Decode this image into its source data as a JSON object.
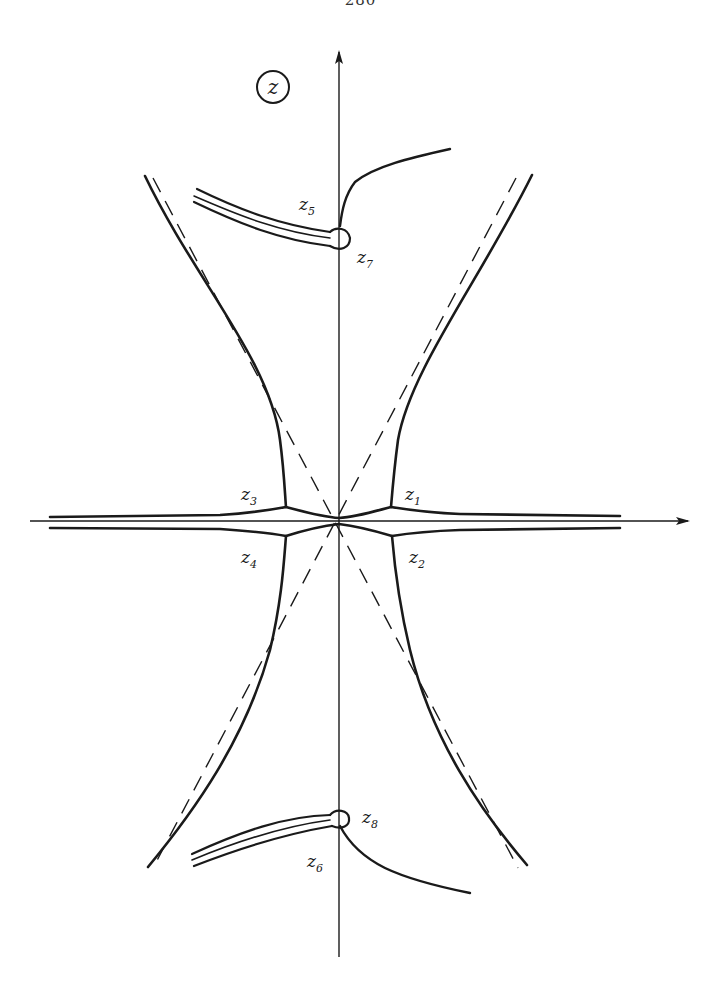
{
  "page": {
    "number": "280"
  },
  "figure": {
    "plane_label": "z",
    "colors": {
      "ink": "#1a1a1a",
      "background": "#ffffff"
    },
    "axes": {
      "horizontal": "real-axis",
      "vertical": "imaginary-axis"
    },
    "points": [
      {
        "id": "z1",
        "base": "z",
        "sub": "1"
      },
      {
        "id": "z2",
        "base": "z",
        "sub": "2"
      },
      {
        "id": "z3",
        "base": "z",
        "sub": "3"
      },
      {
        "id": "z4",
        "base": "z",
        "sub": "4"
      },
      {
        "id": "z5",
        "base": "z",
        "sub": "5"
      },
      {
        "id": "z6",
        "base": "z",
        "sub": "6"
      },
      {
        "id": "z7",
        "base": "z",
        "sub": "7"
      },
      {
        "id": "z8",
        "base": "z",
        "sub": "8"
      }
    ]
  }
}
